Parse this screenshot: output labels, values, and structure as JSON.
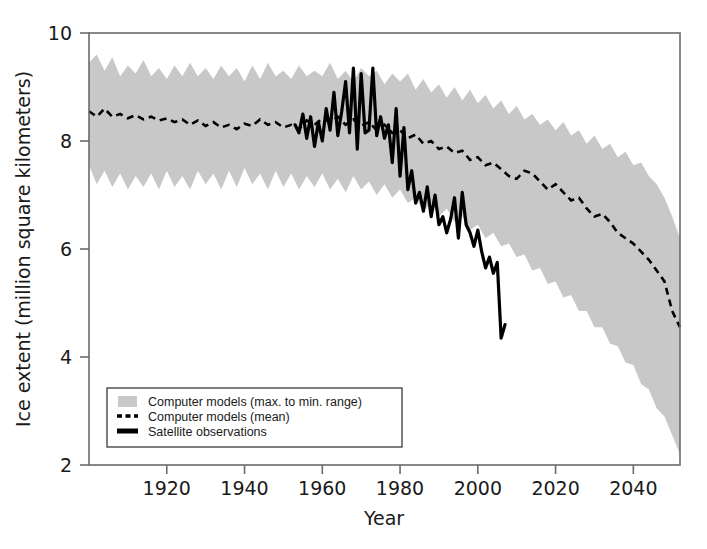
{
  "chart_data": {
    "type": "area",
    "title": "",
    "xlabel": "Year",
    "ylabel": "Ice extent (million square kilometers)",
    "xlim": [
      1900,
      2052
    ],
    "ylim": [
      2,
      10
    ],
    "xticks": [
      1920,
      1940,
      1960,
      1980,
      2000,
      2020,
      2040
    ],
    "xtick_labels": [
      "1920",
      "1940",
      "1960",
      "1980",
      "2000",
      "2020",
      "2040"
    ],
    "yticks": [
      2,
      4,
      6,
      8,
      10
    ],
    "ytick_labels": [
      "2",
      "4",
      "6",
      "8",
      "10"
    ],
    "grid": false,
    "legend_position": "lower left",
    "colors": {
      "band_fill": "#c8c8c8",
      "mean_line": "#000000",
      "observation_line": "#000000",
      "axis": "#6b6b6b",
      "text": "#1a1a1a"
    },
    "series": [
      {
        "name": "Computer models (max. to min. range)",
        "type": "band",
        "style": "filled-area",
        "x": [
          1900,
          1902,
          1904,
          1906,
          1908,
          1910,
          1912,
          1914,
          1916,
          1918,
          1920,
          1922,
          1924,
          1926,
          1928,
          1930,
          1932,
          1934,
          1936,
          1938,
          1940,
          1942,
          1944,
          1946,
          1948,
          1950,
          1952,
          1954,
          1956,
          1958,
          1960,
          1962,
          1964,
          1966,
          1968,
          1970,
          1972,
          1974,
          1976,
          1978,
          1980,
          1982,
          1984,
          1986,
          1988,
          1990,
          1992,
          1994,
          1996,
          1998,
          2000,
          2002,
          2004,
          2006,
          2008,
          2010,
          2012,
          2014,
          2016,
          2018,
          2020,
          2022,
          2024,
          2026,
          2028,
          2030,
          2032,
          2034,
          2036,
          2038,
          2040,
          2042,
          2044,
          2046,
          2048,
          2050,
          2052
        ],
        "upper": [
          9.45,
          9.6,
          9.3,
          9.55,
          9.2,
          9.4,
          9.25,
          9.5,
          9.2,
          9.35,
          9.15,
          9.4,
          9.2,
          9.45,
          9.2,
          9.35,
          9.15,
          9.4,
          9.2,
          9.35,
          9.1,
          9.4,
          9.15,
          9.45,
          9.2,
          9.3,
          9.15,
          9.4,
          9.2,
          9.3,
          9.2,
          9.45,
          9.15,
          9.3,
          9.1,
          9.35,
          9.2,
          9.3,
          9.05,
          9.25,
          9.1,
          9.25,
          8.95,
          9.15,
          8.9,
          9.05,
          8.8,
          9.0,
          8.75,
          8.95,
          8.7,
          8.85,
          8.6,
          8.75,
          8.5,
          8.65,
          8.4,
          8.5,
          8.3,
          8.4,
          8.2,
          8.35,
          8.1,
          8.2,
          7.95,
          8.1,
          7.85,
          7.95,
          7.7,
          7.8,
          7.55,
          7.6,
          7.35,
          7.2,
          6.95,
          6.6,
          6.2
        ],
        "lower": [
          7.55,
          7.2,
          7.45,
          7.15,
          7.4,
          7.1,
          7.35,
          7.15,
          7.4,
          7.1,
          7.45,
          7.15,
          7.35,
          7.1,
          7.45,
          7.2,
          7.4,
          7.1,
          7.45,
          7.15,
          7.5,
          7.2,
          7.4,
          7.1,
          7.45,
          7.15,
          7.4,
          7.1,
          7.35,
          7.15,
          7.4,
          7.1,
          7.3,
          7.05,
          7.35,
          7.1,
          7.25,
          7.0,
          7.2,
          6.95,
          7.1,
          6.85,
          6.95,
          6.7,
          6.85,
          6.6,
          6.75,
          6.5,
          6.6,
          6.35,
          6.45,
          6.2,
          6.3,
          6.05,
          6.1,
          5.85,
          5.9,
          5.6,
          5.65,
          5.35,
          5.4,
          5.1,
          5.15,
          4.85,
          4.85,
          4.55,
          4.55,
          4.25,
          4.2,
          3.9,
          3.85,
          3.5,
          3.4,
          3.05,
          2.9,
          2.55,
          2.2
        ]
      },
      {
        "name": "Computer models (mean)",
        "type": "line",
        "style": "dashed",
        "x": [
          1900,
          1902,
          1904,
          1906,
          1908,
          1910,
          1912,
          1914,
          1916,
          1918,
          1920,
          1922,
          1924,
          1926,
          1928,
          1930,
          1932,
          1934,
          1936,
          1938,
          1940,
          1942,
          1944,
          1946,
          1948,
          1950,
          1952,
          1954,
          1956,
          1958,
          1960,
          1962,
          1964,
          1966,
          1968,
          1970,
          1972,
          1974,
          1976,
          1978,
          1980,
          1982,
          1984,
          1986,
          1988,
          1990,
          1992,
          1994,
          1996,
          1998,
          2000,
          2002,
          2004,
          2006,
          2008,
          2010,
          2012,
          2014,
          2016,
          2018,
          2020,
          2022,
          2024,
          2026,
          2028,
          2030,
          2032,
          2034,
          2036,
          2038,
          2040,
          2042,
          2044,
          2046,
          2048,
          2050,
          2052
        ],
        "y": [
          8.55,
          8.45,
          8.6,
          8.45,
          8.5,
          8.42,
          8.48,
          8.4,
          8.45,
          8.38,
          8.42,
          8.35,
          8.4,
          8.3,
          8.38,
          8.28,
          8.35,
          8.25,
          8.3,
          8.22,
          8.32,
          8.28,
          8.4,
          8.3,
          8.35,
          8.25,
          8.3,
          8.22,
          8.38,
          8.3,
          8.42,
          8.35,
          8.45,
          8.3,
          8.4,
          8.28,
          8.35,
          8.2,
          8.3,
          8.15,
          8.2,
          8.05,
          8.12,
          7.95,
          8.0,
          7.85,
          7.9,
          7.78,
          7.82,
          7.65,
          7.7,
          7.55,
          7.6,
          7.48,
          7.35,
          7.3,
          7.45,
          7.4,
          7.25,
          7.1,
          7.2,
          7.05,
          6.9,
          6.95,
          6.75,
          6.6,
          6.65,
          6.5,
          6.3,
          6.2,
          6.1,
          5.95,
          5.8,
          5.6,
          5.4,
          4.85,
          4.55
        ]
      },
      {
        "name": "Satellite observations",
        "type": "line",
        "style": "solid-thick",
        "x": [
          1953,
          1954,
          1955,
          1956,
          1957,
          1958,
          1959,
          1960,
          1961,
          1962,
          1963,
          1964,
          1965,
          1966,
          1967,
          1968,
          1969,
          1970,
          1971,
          1972,
          1973,
          1974,
          1975,
          1976,
          1977,
          1978,
          1979,
          1980,
          1981,
          1982,
          1983,
          1984,
          1985,
          1986,
          1987,
          1988,
          1989,
          1990,
          1991,
          1992,
          1993,
          1994,
          1995,
          1996,
          1997,
          1998,
          1999,
          2000,
          2001,
          2002,
          2003,
          2004,
          2005,
          2006,
          2007
        ],
        "y": [
          8.3,
          8.15,
          8.5,
          8.05,
          8.45,
          7.9,
          8.35,
          8.0,
          8.6,
          8.2,
          8.9,
          8.1,
          8.55,
          9.1,
          8.15,
          9.35,
          7.85,
          9.25,
          8.15,
          8.2,
          9.35,
          8.1,
          8.45,
          8.05,
          8.3,
          7.6,
          8.6,
          7.35,
          8.25,
          7.1,
          7.45,
          6.85,
          7.05,
          6.7,
          7.15,
          6.6,
          7.0,
          6.45,
          6.6,
          6.3,
          6.55,
          6.95,
          6.2,
          7.05,
          6.45,
          6.3,
          6.05,
          6.35,
          5.95,
          5.65,
          5.85,
          5.55,
          5.75,
          4.35,
          4.6
        ]
      }
    ],
    "annotations": []
  },
  "legend": {
    "items": [
      {
        "label": "Computer models (max. to min. range)",
        "swatch": "band-swatch"
      },
      {
        "label": "Computer models (mean)",
        "swatch": "dashed-line-swatch"
      },
      {
        "label": "Satellite observations",
        "swatch": "solid-line-swatch"
      }
    ]
  },
  "axes": {
    "x_title": "Year",
    "y_title": "Ice extent (million square kilometers)"
  }
}
